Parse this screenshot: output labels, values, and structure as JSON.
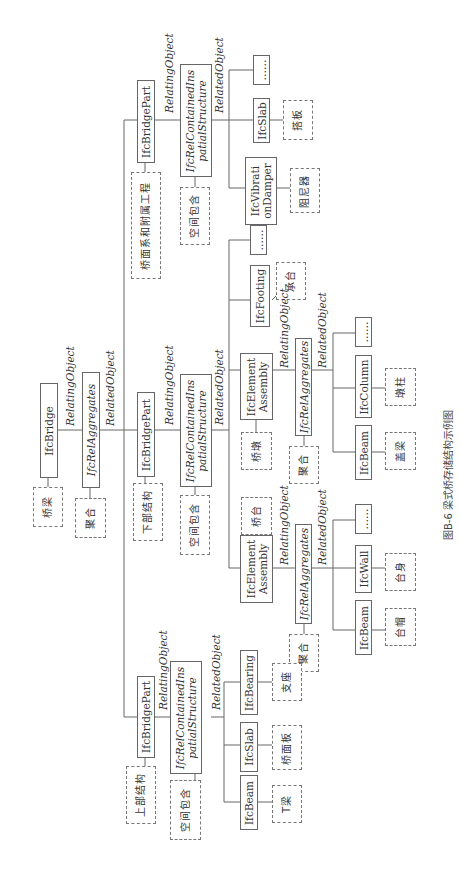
{
  "caption": "图B-6   梁式桥存储结构示例图",
  "edge_labels": {
    "relating": "RelatingObject",
    "related": "RelatedObject"
  },
  "root": {
    "entity": "IfcBridge",
    "entity_tag": "桥梁",
    "rel": "IfcRelAggregates",
    "rel_tag": "聚合"
  },
  "branches": {
    "superstructure": {
      "part": "IfcBridgePart",
      "part_tag": "上部结构",
      "rel": "IfcRelContainedInSpatialStructure",
      "rel_line1": "IfcRelContainedIns",
      "rel_line2": "patialStructure",
      "rel_tag": "空间包含",
      "children": [
        {
          "entity": "IfcBeam",
          "tag": "T梁"
        },
        {
          "entity": "IfcSlab",
          "tag": "桥面板"
        },
        {
          "entity": "IfcBearing",
          "tag": "支座"
        }
      ]
    },
    "substructure": {
      "part": "IfcBridgePart",
      "part_tag": "下部结构",
      "rel_line1": "IfcRelContainedIns",
      "rel_line2": "patialStructure",
      "rel_tag": "空间包含",
      "abutment": {
        "entity_line1": "IfcElement",
        "entity_line2": "Assembly",
        "tag": "桥台",
        "rel": "IfcRelAggregates",
        "rel_tag": "聚合",
        "children": [
          {
            "entity": "IfcBeam",
            "tag": "台帽"
          },
          {
            "entity": "IfcWall",
            "tag": "台身"
          },
          {
            "entity": "……",
            "tag": ""
          }
        ]
      },
      "pier": {
        "entity_line1": "IfcElement",
        "entity_line2": "Assembly",
        "tag": "桥墩",
        "rel": "IfcRelAggregates",
        "rel_tag": "聚合",
        "children": [
          {
            "entity": "IfcBeam",
            "tag": "盖梁"
          },
          {
            "entity": "IfcColumn",
            "tag": "墩柱"
          },
          {
            "entity": "……",
            "tag": ""
          }
        ]
      },
      "footing": {
        "entity": "IfcFooting",
        "tag": "承台"
      },
      "more": "……"
    },
    "deck_system": {
      "part": "IfcBridgePart",
      "part_tag": "桥面系和附属工程",
      "rel_line1": "IfcRelContainedIns",
      "rel_line2": "patialStructure",
      "rel_tag": "空间包含",
      "children": [
        {
          "entity_line1": "IfcVibrati",
          "entity_line2": "onDamper",
          "tag": "阻尼器"
        },
        {
          "entity": "IfcSlab",
          "tag": "搭板"
        },
        {
          "entity": "……",
          "tag": ""
        }
      ]
    }
  }
}
